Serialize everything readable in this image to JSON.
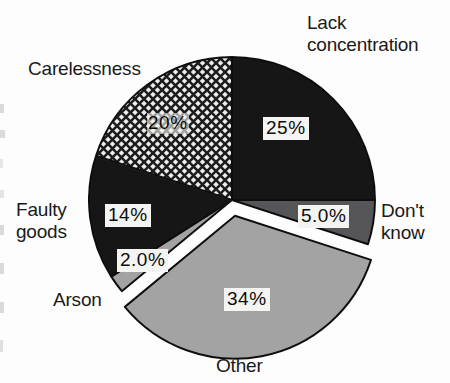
{
  "chart_data": {
    "type": "pie",
    "title": "",
    "subtitle": "",
    "xlabel": "",
    "ylabel": "",
    "legend_position": "none",
    "grid": false,
    "units": "percent",
    "start_angle_deg": 0,
    "direction": "clockwise",
    "center": {
      "x": 232,
      "y": 200
    },
    "radius": 143,
    "categories": [
      "Lack concentration",
      "Don't know",
      "Other",
      "Arson",
      "Faulty goods",
      "Carelessness"
    ],
    "values": [
      25,
      5.0,
      34,
      2.0,
      14,
      20
    ],
    "value_labels": [
      "25%",
      "5.0%",
      "34%",
      "2.0%",
      "14%",
      "20%"
    ],
    "slices": [
      {
        "name": "Lack concentration",
        "label": "Lack\nconcentration",
        "value": 25,
        "value_label": "25%",
        "fill": "#161616",
        "pattern": "solid",
        "exploded": false,
        "start_deg": 0,
        "end_deg": 90
      },
      {
        "name": "Don't know",
        "label": "Don't\n know",
        "value": 5.0,
        "value_label": "5.0%",
        "fill": "#58585a",
        "pattern": "solid",
        "exploded": false,
        "start_deg": 90,
        "end_deg": 108
      },
      {
        "name": "Other",
        "label": "Other",
        "value": 34,
        "value_label": "34%",
        "fill": "#a6a6a6",
        "pattern": "solid",
        "exploded": true,
        "start_deg": 108,
        "end_deg": 230.4
      },
      {
        "name": "Arson",
        "label": "Arson",
        "value": 2.0,
        "value_label": "2.0%",
        "fill": "#a6a6a6",
        "pattern": "solid",
        "exploded": false,
        "start_deg": 230.4,
        "end_deg": 237.6
      },
      {
        "name": "Faulty goods",
        "label": "Faulty\ngoods",
        "value": 14,
        "value_label": "14%",
        "fill": "#161616",
        "pattern": "solid",
        "exploded": false,
        "start_deg": 237.6,
        "end_deg": 288
      },
      {
        "name": "Carelessness",
        "label": "Carelessness",
        "value": 20,
        "value_label": "20%",
        "fill": "#f2f2f0",
        "pattern": "crosshatch",
        "exploded": false,
        "start_deg": 288,
        "end_deg": 360
      }
    ],
    "colors": {
      "black_slice": "#161616",
      "dark_gray_slice": "#58585a",
      "light_gray_slice": "#a6a6a6",
      "hatch_slice_background": "#f2f2f0",
      "hatch_line": "#1f1f1f",
      "outline": "#101010",
      "label_text": "#1a1a1a",
      "value_box_background": "#f4f4f2",
      "page_background": "#fdfdfd"
    }
  }
}
